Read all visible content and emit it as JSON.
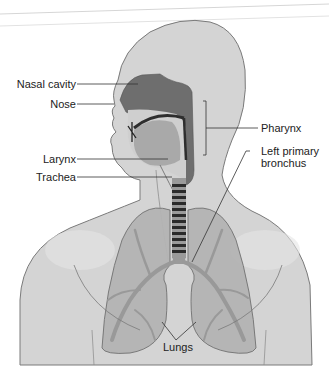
{
  "diagram": {
    "labels": {
      "nasal_cavity": "Nasal cavity",
      "nose": "Nose",
      "larynx": "Larynx",
      "trachea": "Trachea",
      "pharynx": "Pharynx",
      "left_primary_bronchus_line1": "Left primary",
      "left_primary_bronchus_line2": "bronchus",
      "lungs": "Lungs"
    },
    "colors": {
      "body": "#d4d4d4",
      "outline": "#777777",
      "cavity_dark": "#6e6e6e",
      "airway_dark": "#3a3a3a",
      "lung_fill": "#b2b2b2",
      "bronchi": "#999999",
      "text": "#222222"
    }
  }
}
